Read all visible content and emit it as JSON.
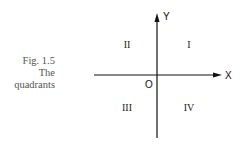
{
  "figure": {
    "caption": {
      "number": "Fig.  1.5",
      "line2": "The",
      "line3": "quadrants"
    },
    "axes": {
      "x_label": "X",
      "y_label": "Y",
      "origin_label": "O"
    },
    "quadrants": {
      "q1": "I",
      "q2": "II",
      "q3": "III",
      "q4": "IV"
    },
    "colors": {
      "axis": "#111111",
      "text": "#222222",
      "caption": "#555555"
    }
  }
}
